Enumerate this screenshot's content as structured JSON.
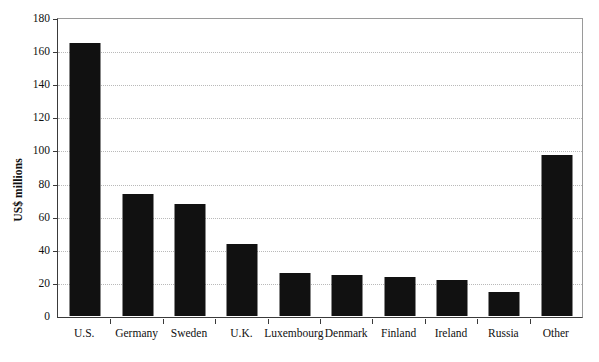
{
  "chart_data": {
    "type": "bar",
    "title": "",
    "subtitle": "",
    "xlabel": "",
    "ylabel": "US$ millions",
    "categories": [
      "U.S.",
      "Germany",
      "Sweden",
      "U.K.",
      "Luxembourg",
      "Denmark",
      "Finland",
      "Ireland",
      "Russia",
      "Other"
    ],
    "values": [
      165,
      74,
      67.5,
      43.5,
      26,
      25,
      23.5,
      21.5,
      14.5,
      97.5
    ],
    "ylim": [
      0,
      180
    ],
    "ytick_step": 20,
    "yticks": [
      0,
      20,
      40,
      60,
      80,
      100,
      120,
      140,
      160,
      180
    ],
    "ytick_labels": [
      "0",
      "20",
      "40",
      "60",
      "80",
      "100",
      "120",
      "140",
      "160",
      "180"
    ],
    "grid": true,
    "grid_axis": "y",
    "grid_style": "dotted",
    "legend": false,
    "legend_position": "none",
    "bar_color": "#111111",
    "grid_color": "#b9b9b9",
    "axis_color": "#3a3a3a",
    "frame_color": "#9a9a9a",
    "background_color": "#ffffff",
    "annotations": []
  }
}
